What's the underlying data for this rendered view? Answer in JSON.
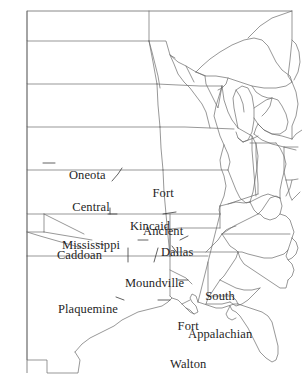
{
  "map": {
    "title": "Mississippian Culture Regions of the Eastern United States",
    "projection_note": "outline map of eastern United States with state boundaries, Great Lakes and coastlines",
    "background_color": "#ffffff",
    "outline_color": "#6b6b6b",
    "label_color": "#1f1f1f",
    "leader_color": "#3a3a3a",
    "frame": {
      "x": 27,
      "y": 11,
      "width": 270,
      "height": 362
    },
    "labels": [
      {
        "id": "oneota",
        "text": "Oneota",
        "line2": "",
        "x": 56,
        "y": 157,
        "leader": "left"
      },
      {
        "id": "central-mississippi",
        "text": "Central",
        "line2": "Mississippi",
        "x": 66,
        "y": 176,
        "leader": "none"
      },
      {
        "id": "fort-ancient",
        "text": "Fort",
        "line2": "Ancient",
        "x": 147,
        "y": 163,
        "leader": "none"
      },
      {
        "id": "kincaid",
        "text": "Kincaid",
        "line2": "",
        "x": 118,
        "y": 207,
        "leader": "both"
      },
      {
        "id": "caddoan",
        "text": "Caddoan",
        "line2": "",
        "x": 44,
        "y": 236,
        "leader": "right"
      },
      {
        "id": "dallas",
        "text": "Dallas",
        "line2": "",
        "x": 148,
        "y": 233,
        "leader": "both"
      },
      {
        "id": "moundville",
        "text": "Moundville",
        "line2": "",
        "x": 112,
        "y": 264,
        "leader": "up"
      },
      {
        "id": "south-appalachian",
        "text": "South",
        "line2": "Appalachian",
        "x": 188,
        "y": 266,
        "leader": "left"
      },
      {
        "id": "plaquemine",
        "text": "Plaquemine",
        "line2": "",
        "x": 49,
        "y": 290,
        "leader": "right"
      },
      {
        "id": "fort-walton",
        "text": "Fort",
        "line2": "Walton",
        "x": 170,
        "y": 295,
        "leader": "left"
      }
    ]
  }
}
